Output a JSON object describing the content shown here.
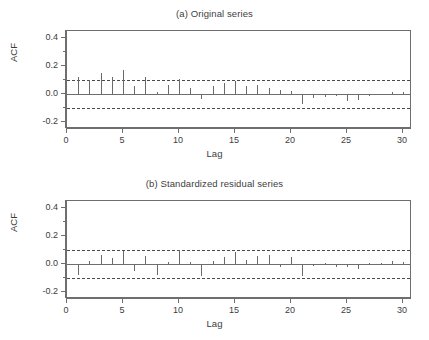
{
  "figure": {
    "y_axis_title": "ACF",
    "x_axis_title": "Lag",
    "y_ticks": [
      "0.4",
      "0.2",
      "0.0",
      "-0.2"
    ],
    "x_ticks": [
      "0",
      "5",
      "10",
      "15",
      "20",
      "25",
      "30"
    ],
    "line_color": "#6a6a6a",
    "frame_color": "#6e6e6e",
    "conf_color": "#4a4a4a"
  },
  "chart_data": [
    {
      "type": "bar",
      "title": "(a) Original series",
      "xlabel": "Lag",
      "ylabel": "ACF",
      "xlim": [
        0,
        30.8
      ],
      "ylim": [
        -0.25,
        0.45
      ],
      "yticks": [
        0.4,
        0.2,
        0.0,
        -0.2
      ],
      "yticks_minor": [
        0.3,
        0.1,
        -0.1
      ],
      "xticks": [
        0,
        5,
        10,
        15,
        20,
        25,
        30
      ],
      "grid": false,
      "legend": "none",
      "confidence_bounds": [
        0.098,
        -0.098
      ],
      "x": [
        1,
        2,
        3,
        4,
        5,
        6,
        7,
        8,
        9,
        10,
        11,
        12,
        13,
        14,
        15,
        16,
        17,
        18,
        19,
        20,
        21,
        22,
        23,
        24,
        25,
        26,
        27,
        28,
        29,
        30
      ],
      "values": [
        0.123,
        0.098,
        0.153,
        0.125,
        0.168,
        0.059,
        0.122,
        0.012,
        0.062,
        0.108,
        0.044,
        -0.033,
        0.055,
        0.081,
        0.094,
        0.059,
        0.063,
        0.043,
        0.028,
        0.022,
        -0.072,
        -0.031,
        -0.022,
        -0.016,
        -0.049,
        -0.043,
        -0.013,
        -0.008,
        0.016,
        0.012
      ]
    },
    {
      "type": "bar",
      "title": "(b) Standardized residual series",
      "xlabel": "Lag",
      "ylabel": "ACF",
      "xlim": [
        0,
        30.8
      ],
      "ylim": [
        -0.25,
        0.45
      ],
      "yticks": [
        0.4,
        0.2,
        0.0,
        -0.2
      ],
      "yticks_minor": [
        0.3,
        0.1,
        -0.1
      ],
      "xticks": [
        0,
        5,
        10,
        15,
        20,
        25,
        30
      ],
      "grid": false,
      "legend": "none",
      "confidence_bounds": [
        0.098,
        -0.098
      ],
      "x": [
        1,
        2,
        3,
        4,
        5,
        6,
        7,
        8,
        9,
        10,
        11,
        12,
        13,
        14,
        15,
        16,
        17,
        18,
        19,
        20,
        21,
        22,
        23,
        24,
        25,
        26,
        27,
        28,
        29,
        30
      ],
      "values": [
        -0.082,
        0.018,
        0.064,
        0.041,
        0.092,
        -0.051,
        0.058,
        -0.077,
        0.013,
        0.098,
        0.014,
        -0.086,
        0.019,
        0.048,
        0.088,
        0.026,
        0.056,
        0.061,
        -0.024,
        0.051,
        -0.088,
        -0.011,
        0.008,
        -0.019,
        -0.021,
        -0.038,
        0.004,
        0.006,
        0.019,
        0.014
      ]
    }
  ]
}
